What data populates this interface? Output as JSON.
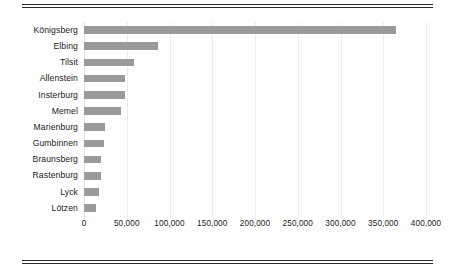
{
  "chart_data": {
    "type": "bar",
    "orientation": "horizontal",
    "title": "",
    "subtitle": "",
    "xlabel": "",
    "ylabel": "",
    "categories": [
      "Königsberg",
      "Elbing",
      "Tilsit",
      "Allenstein",
      "Insterburg",
      "Memel",
      "Marienburg",
      "Gumbinnen",
      "Braunsberg",
      "Rastenburg",
      "Lyck",
      "Lötzen"
    ],
    "values": [
      365000,
      86000,
      59000,
      48000,
      48000,
      43000,
      24000,
      23000,
      20000,
      20000,
      17000,
      14000
    ],
    "xlim": [
      0,
      400000
    ],
    "xticks": [
      0,
      50000,
      100000,
      150000,
      200000,
      250000,
      300000,
      350000,
      400000
    ],
    "xtick_labels": [
      "0",
      "50,000",
      "100,000",
      "150,000",
      "200,000",
      "250,000",
      "300,000",
      "350,000",
      "400,000"
    ],
    "grid": true,
    "grid_axis": "x",
    "legend": false,
    "legend_position": "none",
    "bar_color": "#9a9a9a",
    "grid_color": "#ececec",
    "text_color": "#1a1a1a",
    "rule_color": "#2b2b2b",
    "background_color": "#ffffff"
  }
}
